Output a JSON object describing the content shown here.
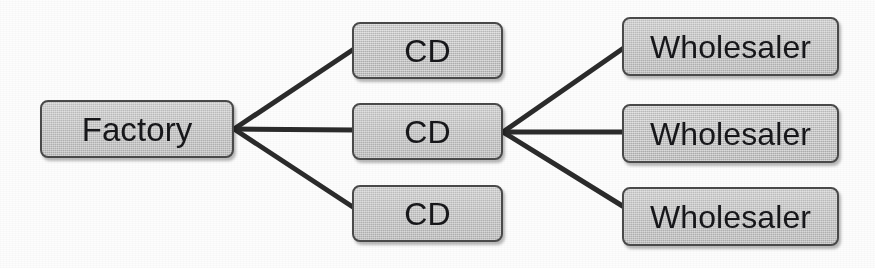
{
  "diagram": {
    "type": "node-link",
    "background_color": "#ffffff",
    "node_fill_color": "#c6c6c6",
    "node_border_color": "#4a4a4a",
    "edge_color": "#2b2b2b",
    "text_color": "#17171a",
    "nodes": [
      {
        "id": "factory",
        "label": "Factory",
        "column": "source",
        "x": 40,
        "y": 100,
        "w": 194,
        "h": 58
      },
      {
        "id": "cd-0",
        "label": "CD",
        "column": "middle",
        "x": 352,
        "y": 22,
        "w": 151,
        "h": 57
      },
      {
        "id": "cd-1",
        "label": "CD",
        "column": "middle",
        "x": 352,
        "y": 103,
        "w": 151,
        "h": 57
      },
      {
        "id": "cd-2",
        "label": "CD",
        "column": "middle",
        "x": 352,
        "y": 185,
        "w": 151,
        "h": 57
      },
      {
        "id": "wholesaler-0",
        "label": "Wholesaler",
        "column": "destination",
        "x": 622,
        "y": 17,
        "w": 217,
        "h": 59
      },
      {
        "id": "wholesaler-1",
        "label": "Wholesaler",
        "column": "destination",
        "x": 622,
        "y": 104,
        "w": 217,
        "h": 59
      },
      {
        "id": "wholesaler-2",
        "label": "Wholesaler",
        "column": "destination",
        "x": 622,
        "y": 187,
        "w": 217,
        "h": 59
      }
    ],
    "junctions": [
      {
        "id": "junction-left",
        "x": 234,
        "y": 129
      },
      {
        "id": "junction-right",
        "x": 503,
        "y": 132
      }
    ],
    "edges": [
      {
        "id": "edge-factory-cd-0",
        "from": "junction-left",
        "to": "cd-0",
        "x1": 234,
        "y1": 129,
        "x2": 357,
        "y2": 47
      },
      {
        "id": "edge-factory-cd-1",
        "from": "junction-left",
        "to": "cd-1",
        "x1": 234,
        "y1": 129,
        "x2": 354,
        "y2": 130
      },
      {
        "id": "edge-factory-cd-2",
        "from": "junction-left",
        "to": "cd-2",
        "x1": 234,
        "y1": 129,
        "x2": 362,
        "y2": 213
      },
      {
        "id": "edge-cd-wholesaler-0",
        "from": "junction-right",
        "to": "wholesaler-0",
        "x1": 503,
        "y1": 132,
        "x2": 628,
        "y2": 45
      },
      {
        "id": "edge-cd-wholesaler-1",
        "from": "junction-right",
        "to": "wholesaler-1",
        "x1": 503,
        "y1": 132,
        "x2": 626,
        "y2": 132
      },
      {
        "id": "edge-cd-wholesaler-2",
        "from": "junction-right",
        "to": "wholesaler-2",
        "x1": 503,
        "y1": 132,
        "x2": 629,
        "y2": 210
      }
    ],
    "edge_width": 5
  }
}
